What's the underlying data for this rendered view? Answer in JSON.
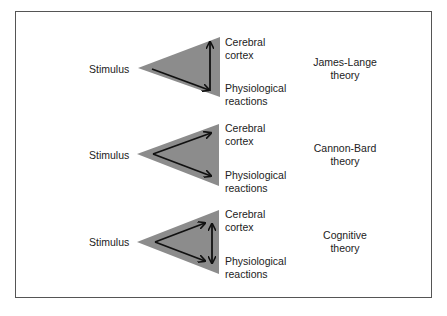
{
  "diagram": {
    "colors": {
      "triangle": "#8c8c8c",
      "arrow": "#111111",
      "border": "#555555"
    },
    "sections": [
      {
        "stimulus": "Stimulus",
        "cortex": [
          "Cerebral",
          "cortex"
        ],
        "physio": [
          "Physiological",
          "reactions"
        ],
        "theory": [
          "James-Lange",
          "theory"
        ],
        "arrows": "stimulus→physiological, physiological→cortex"
      },
      {
        "stimulus": "Stimulus",
        "cortex": [
          "Cerebral",
          "cortex"
        ],
        "physio": [
          "Physiological",
          "reactions"
        ],
        "theory": [
          "Cannon-Bard",
          "theory"
        ],
        "arrows": "stimulus→cortex, stimulus→physiological"
      },
      {
        "stimulus": "Stimulus",
        "cortex": [
          "Cerebral",
          "cortex"
        ],
        "physio": [
          "Physiological",
          "reactions"
        ],
        "theory": [
          "Cognitive",
          "theory"
        ],
        "arrows": "stimulus→cortex, stimulus→physiological, cortex↔physiological"
      }
    ]
  }
}
